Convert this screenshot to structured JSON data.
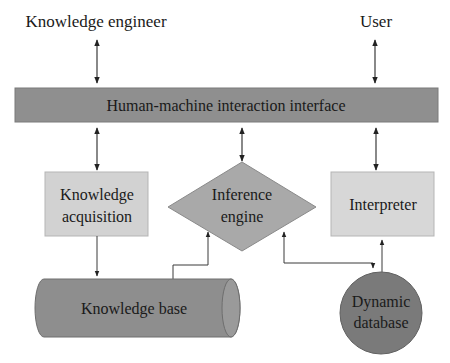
{
  "actors": {
    "knowledge_engineer": "Knowledge engineer",
    "user": "User"
  },
  "interface": {
    "label": "Human-machine interaction interface"
  },
  "modules": {
    "knowledge_acquisition": [
      "Knowledge",
      "acquisition"
    ],
    "inference_engine": [
      "Inference",
      "engine"
    ],
    "interpreter": "Interpreter"
  },
  "stores": {
    "knowledge_base": "Knowledge base",
    "dynamic_database": [
      "Dynamic",
      "database"
    ]
  },
  "colors": {
    "bar_fill": "#8f8f8f",
    "box_fill": "#d2d2d2",
    "diamond_fill": "#a9a9a9",
    "cylinder_fill": "#8e8e8e",
    "circle_fill": "#7a7a7a",
    "line": "#3a3a3a"
  }
}
